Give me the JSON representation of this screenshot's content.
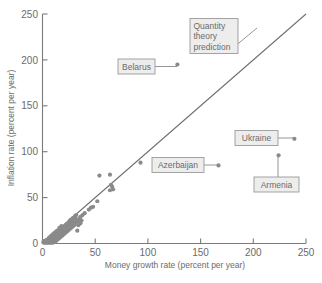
{
  "chart_data": {
    "type": "scatter",
    "title": "",
    "xlabel": "Money growth rate (percent per year)",
    "ylabel": "Inflation rate (percent per year)",
    "xlim": [
      0,
      250
    ],
    "ylim": [
      0,
      250
    ],
    "xticks": [
      0,
      50,
      100,
      150,
      200,
      250
    ],
    "yticks": [
      0,
      50,
      100,
      150,
      200,
      250
    ],
    "xtick_labels": [
      "0",
      "50",
      "100",
      "150",
      "200",
      "250"
    ],
    "ytick_labels": [
      "0",
      "50",
      "100",
      "150",
      "200",
      "250"
    ],
    "grid": false,
    "legend": "none",
    "series": [
      {
        "name": "Countries",
        "marker_color": "#8a8a8a",
        "points": [
          {
            "x": 128,
            "y": 195,
            "label": "Belarus"
          },
          {
            "x": 167,
            "y": 85,
            "label": "Azerbaijan"
          },
          {
            "x": 239,
            "y": 114,
            "label": "Ukraine"
          },
          {
            "x": 224,
            "y": 96,
            "label": "Armenia"
          },
          {
            "x": 93,
            "y": 88
          },
          {
            "x": 65,
            "y": 64
          },
          {
            "x": 66,
            "y": 62
          },
          {
            "x": 64,
            "y": 58
          },
          {
            "x": 67,
            "y": 59
          },
          {
            "x": 54,
            "y": 74
          },
          {
            "x": 64,
            "y": 75
          },
          {
            "x": 52,
            "y": 46
          },
          {
            "x": 46,
            "y": 39
          },
          {
            "x": 44,
            "y": 37
          },
          {
            "x": 48,
            "y": 40
          },
          {
            "x": 40,
            "y": 33
          },
          {
            "x": 38,
            "y": 31
          },
          {
            "x": 36,
            "y": 29
          },
          {
            "x": 35,
            "y": 27
          },
          {
            "x": 34,
            "y": 25
          },
          {
            "x": 33,
            "y": 24
          },
          {
            "x": 32,
            "y": 31
          },
          {
            "x": 31,
            "y": 22
          },
          {
            "x": 30,
            "y": 27
          },
          {
            "x": 30,
            "y": 20
          },
          {
            "x": 29,
            "y": 19
          },
          {
            "x": 28,
            "y": 24
          },
          {
            "x": 28,
            "y": 18
          },
          {
            "x": 27,
            "y": 17
          },
          {
            "x": 26,
            "y": 21
          },
          {
            "x": 26,
            "y": 16
          },
          {
            "x": 25,
            "y": 15
          },
          {
            "x": 33,
            "y": 14
          },
          {
            "x": 24,
            "y": 19
          },
          {
            "x": 24,
            "y": 14
          },
          {
            "x": 23,
            "y": 13
          },
          {
            "x": 22,
            "y": 17
          },
          {
            "x": 22,
            "y": 12
          },
          {
            "x": 21,
            "y": 11
          },
          {
            "x": 21,
            "y": 15
          },
          {
            "x": 20,
            "y": 10
          },
          {
            "x": 20,
            "y": 14
          },
          {
            "x": 19,
            "y": 9
          },
          {
            "x": 19,
            "y": 13
          },
          {
            "x": 18,
            "y": 8
          },
          {
            "x": 18,
            "y": 12
          },
          {
            "x": 17,
            "y": 7
          },
          {
            "x": 17,
            "y": 11
          },
          {
            "x": 16,
            "y": 6
          },
          {
            "x": 16,
            "y": 10
          },
          {
            "x": 15,
            "y": 5
          },
          {
            "x": 15,
            "y": 9
          },
          {
            "x": 14,
            "y": 4
          },
          {
            "x": 14,
            "y": 8
          },
          {
            "x": 13,
            "y": 3
          },
          {
            "x": 13,
            "y": 7
          },
          {
            "x": 12,
            "y": 2
          },
          {
            "x": 12,
            "y": 6
          },
          {
            "x": 11,
            "y": 2
          },
          {
            "x": 11,
            "y": 5
          },
          {
            "x": 10,
            "y": 1
          },
          {
            "x": 10,
            "y": 4
          },
          {
            "x": 9,
            "y": 1
          },
          {
            "x": 9,
            "y": 3
          },
          {
            "x": 8,
            "y": 1
          },
          {
            "x": 8,
            "y": 3
          },
          {
            "x": 7,
            "y": 1
          },
          {
            "x": 7,
            "y": 2
          },
          {
            "x": 6,
            "y": 1
          },
          {
            "x": 6,
            "y": 2
          },
          {
            "x": 5,
            "y": 1
          },
          {
            "x": 5,
            "y": 2
          },
          {
            "x": 4,
            "y": 1
          },
          {
            "x": 4,
            "y": 2
          },
          {
            "x": 3,
            "y": 1
          },
          {
            "x": 3,
            "y": 2
          },
          {
            "x": 2,
            "y": 1
          },
          {
            "x": 2,
            "y": 2
          },
          {
            "x": 1,
            "y": 1
          },
          {
            "x": 1,
            "y": 2
          },
          {
            "x": 12,
            "y": 9
          },
          {
            "x": 13,
            "y": 10
          },
          {
            "x": 14,
            "y": 11
          },
          {
            "x": 15,
            "y": 12
          },
          {
            "x": 16,
            "y": 13
          },
          {
            "x": 17,
            "y": 14
          },
          {
            "x": 18,
            "y": 15
          },
          {
            "x": 19,
            "y": 16
          },
          {
            "x": 20,
            "y": 17
          },
          {
            "x": 21,
            "y": 18
          },
          {
            "x": 22,
            "y": 20
          },
          {
            "x": 23,
            "y": 21
          },
          {
            "x": 24,
            "y": 22
          },
          {
            "x": 25,
            "y": 23
          },
          {
            "x": 26,
            "y": 25
          },
          {
            "x": 27,
            "y": 26
          },
          {
            "x": 29,
            "y": 28
          },
          {
            "x": 31,
            "y": 30
          },
          {
            "x": 9,
            "y": 6
          },
          {
            "x": 8,
            "y": 5
          },
          {
            "x": 7,
            "y": 4
          },
          {
            "x": 6,
            "y": 4
          },
          {
            "x": 5,
            "y": 3
          },
          {
            "x": 10,
            "y": 7
          },
          {
            "x": 11,
            "y": 8
          },
          {
            "x": 6,
            "y": 6
          },
          {
            "x": 7,
            "y": 7
          },
          {
            "x": 8,
            "y": 8
          },
          {
            "x": 9,
            "y": 9
          },
          {
            "x": 10,
            "y": 10
          },
          {
            "x": 11,
            "y": 11
          },
          {
            "x": 4,
            "y": 4
          },
          {
            "x": 3,
            "y": 3
          },
          {
            "x": 2,
            "y": 3
          },
          {
            "x": 13,
            "y": 13
          },
          {
            "x": 14,
            "y": 14
          },
          {
            "x": 12,
            "y": 12
          },
          {
            "x": 16,
            "y": 17
          },
          {
            "x": 18,
            "y": 19
          },
          {
            "x": 23,
            "y": 16
          },
          {
            "x": 27,
            "y": 21
          },
          {
            "x": 30,
            "y": 23
          },
          {
            "x": 34,
            "y": 20
          },
          {
            "x": 36,
            "y": 22
          },
          {
            "x": 37,
            "y": 25
          },
          {
            "x": 32,
            "y": 26
          },
          {
            "x": 31,
            "y": 27
          }
        ]
      }
    ],
    "reference_line": {
      "name": "Quantity theory prediction",
      "from": {
        "x": 0,
        "y": 0
      },
      "to": {
        "x": 250,
        "y": 250
      },
      "color": "#6e6e6e"
    },
    "annotations": [
      {
        "name": "quantity-theory-prediction",
        "lines": [
          "Quantity",
          "theory",
          "prediction"
        ],
        "target": {
          "x": 150,
          "y": 152
        }
      },
      {
        "name": "belarus",
        "lines": [
          "Belarus"
        ],
        "target": {
          "x": 128,
          "y": 195
        }
      },
      {
        "name": "azerbaijan",
        "lines": [
          "Azerbaijan"
        ],
        "target": {
          "x": 167,
          "y": 85
        }
      },
      {
        "name": "ukraine",
        "lines": [
          "Ukraine"
        ],
        "target": {
          "x": 239,
          "y": 114
        }
      },
      {
        "name": "armenia",
        "lines": [
          "Armenia"
        ],
        "target": {
          "x": 224,
          "y": 96
        }
      }
    ]
  },
  "colors": {
    "marker": "#8a8a8a",
    "axis": "#7a7a7a",
    "text": "#6b6b6b",
    "callout_fill": "#ededed",
    "callout_border": "#9a9a9a",
    "background": "#ffffff"
  },
  "axes": {
    "x_title": "Money growth rate (percent per year)",
    "y_title": "Inflation rate (percent per year)",
    "x_ticks": [
      "0",
      "50",
      "100",
      "150",
      "200",
      "250"
    ],
    "y_ticks": [
      "0",
      "50",
      "100",
      "150",
      "200",
      "250"
    ]
  },
  "callouts": {
    "quantity": {
      "l1": "Quantity",
      "l2": "theory",
      "l3": "prediction"
    },
    "belarus": "Belarus",
    "azerbaijan": "Azerbaijan",
    "ukraine": "Ukraine",
    "armenia": "Armenia"
  }
}
